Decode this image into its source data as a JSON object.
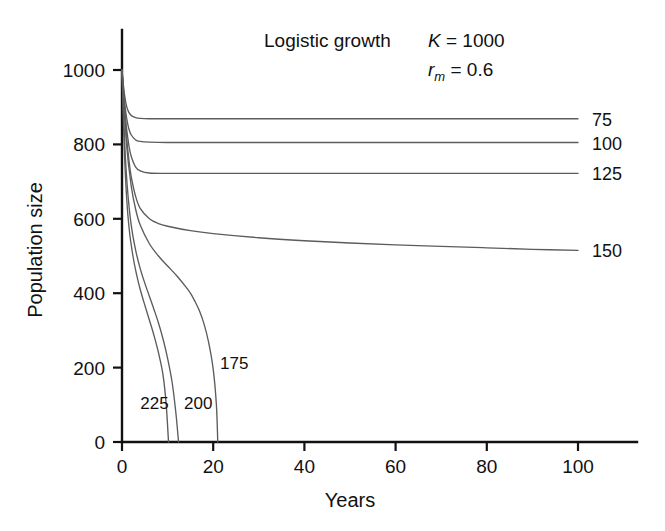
{
  "chart_data": {
    "type": "line",
    "title": "Logistic growth",
    "annotations": [
      {
        "text_italic": "K",
        "text_rest": " = 1000"
      },
      {
        "text_italic": "r",
        "text_sub": "m",
        "text_rest": " = 0.6"
      }
    ],
    "xlabel": "Years",
    "ylabel": "Population size",
    "xlim": [
      0,
      100
    ],
    "ylim": [
      0,
      1000
    ],
    "xticks": [
      0,
      20,
      40,
      60,
      80,
      100
    ],
    "xticklabels": [
      "0",
      "20",
      "40",
      "60",
      "80",
      "100"
    ],
    "yticks": [
      0,
      200,
      400,
      600,
      800,
      1000
    ],
    "yticklabels": [
      "0",
      "200",
      "400",
      "600",
      "800",
      "1000"
    ],
    "grid": false,
    "legend_position": "inline-right",
    "line_color": "#5c5c5c",
    "axis_color": "#111111",
    "series": [
      {
        "name": "75",
        "label": "75",
        "label_side": "right",
        "points": [
          [
            0,
            1000
          ],
          [
            0.3,
            960
          ],
          [
            0.6,
            930
          ],
          [
            1,
            903
          ],
          [
            1.5,
            886
          ],
          [
            2,
            878
          ],
          [
            3,
            872
          ],
          [
            4,
            870
          ],
          [
            6,
            869
          ],
          [
            10,
            869
          ],
          [
            20,
            869
          ],
          [
            40,
            869
          ],
          [
            60,
            869
          ],
          [
            80,
            869
          ],
          [
            100,
            869
          ]
        ]
      },
      {
        "name": "100",
        "label": "100",
        "label_side": "right",
        "points": [
          [
            0,
            1000
          ],
          [
            0.3,
            950
          ],
          [
            0.6,
            910
          ],
          [
            1,
            872
          ],
          [
            1.5,
            842
          ],
          [
            2,
            826
          ],
          [
            3,
            812
          ],
          [
            4,
            808
          ],
          [
            6,
            806
          ],
          [
            10,
            805
          ],
          [
            20,
            805
          ],
          [
            40,
            805
          ],
          [
            60,
            805
          ],
          [
            80,
            805
          ],
          [
            100,
            805
          ]
        ]
      },
      {
        "name": "125",
        "label": "125",
        "label_side": "right",
        "points": [
          [
            0,
            1000
          ],
          [
            0.3,
            940
          ],
          [
            0.6,
            892
          ],
          [
            1,
            843
          ],
          [
            1.5,
            798
          ],
          [
            2,
            769
          ],
          [
            3,
            739
          ],
          [
            4,
            729
          ],
          [
            6,
            723
          ],
          [
            10,
            722
          ],
          [
            20,
            722
          ],
          [
            40,
            722
          ],
          [
            60,
            722
          ],
          [
            80,
            722
          ],
          [
            100,
            722
          ]
        ]
      },
      {
        "name": "150",
        "label": "150",
        "label_side": "right",
        "points": [
          [
            0,
            1000
          ],
          [
            0.5,
            905
          ],
          [
            1,
            820
          ],
          [
            1.5,
            760
          ],
          [
            2,
            715
          ],
          [
            3,
            660
          ],
          [
            4,
            628
          ],
          [
            6,
            600
          ],
          [
            8,
            587
          ],
          [
            10,
            580
          ],
          [
            15,
            568
          ],
          [
            20,
            560
          ],
          [
            30,
            549
          ],
          [
            40,
            541
          ],
          [
            50,
            535
          ],
          [
            60,
            530
          ],
          [
            70,
            526
          ],
          [
            80,
            522
          ],
          [
            90,
            518
          ],
          [
            100,
            515
          ]
        ]
      },
      {
        "name": "175",
        "label": "175",
        "label_side": "inner",
        "label_x": 21.5,
        "label_y": 195,
        "points": [
          [
            0,
            1000
          ],
          [
            1,
            800
          ],
          [
            2,
            690
          ],
          [
            3,
            625
          ],
          [
            4,
            583
          ],
          [
            6,
            533
          ],
          [
            8,
            500
          ],
          [
            10,
            473
          ],
          [
            12,
            447
          ],
          [
            14,
            417
          ],
          [
            15,
            400
          ],
          [
            16,
            378
          ],
          [
            17,
            352
          ],
          [
            18,
            317
          ],
          [
            19,
            268
          ],
          [
            20,
            196
          ],
          [
            20.7,
            100
          ],
          [
            21,
            0
          ]
        ]
      },
      {
        "name": "200",
        "label": "200",
        "label_side": "inner",
        "label_x": 13.6,
        "label_y": 88,
        "points": [
          [
            0,
            1000
          ],
          [
            0.6,
            800
          ],
          [
            1.2,
            680
          ],
          [
            2,
            585
          ],
          [
            3,
            515
          ],
          [
            4,
            466
          ],
          [
            5,
            427
          ],
          [
            6,
            392
          ],
          [
            7,
            357
          ],
          [
            8,
            320
          ],
          [
            9,
            277
          ],
          [
            10,
            225
          ],
          [
            11,
            160
          ],
          [
            11.8,
            80
          ],
          [
            12.4,
            0
          ]
        ]
      },
      {
        "name": "225",
        "label": "225",
        "label_side": "inner",
        "label_x": 4.0,
        "label_y": 88,
        "points": [
          [
            0,
            1000
          ],
          [
            0.5,
            790
          ],
          [
            1,
            660
          ],
          [
            1.6,
            570
          ],
          [
            2.4,
            500
          ],
          [
            3.2,
            450
          ],
          [
            4,
            410
          ],
          [
            5,
            368
          ],
          [
            6,
            328
          ],
          [
            7,
            287
          ],
          [
            8,
            240
          ],
          [
            9,
            180
          ],
          [
            9.7,
            100
          ],
          [
            10.2,
            0
          ]
        ]
      }
    ]
  },
  "plot_geometry": {
    "x0_px": 122,
    "x100_px": 578,
    "y0_px": 442,
    "y1000_px": 70,
    "axis_top_px": 30,
    "axis_right_px": 637
  },
  "labels": {
    "right_label_x_px": 592,
    "right_tick_len_px": 22
  }
}
